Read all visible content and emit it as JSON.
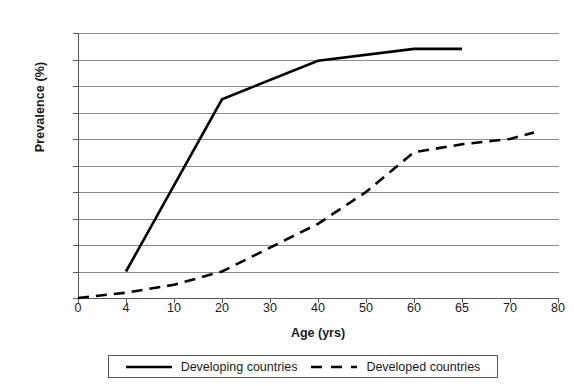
{
  "chart_data": {
    "type": "line",
    "title": "",
    "subtitle": "",
    "xlabel": "Age (yrs)",
    "ylabel": "Prevalence (%)",
    "categories": [
      "0",
      "4",
      "10",
      "20",
      "30",
      "40",
      "50",
      "60",
      "65",
      "70",
      "80"
    ],
    "x_tick_labels": [
      "0",
      "4",
      "10",
      "20",
      "30",
      "40",
      "50",
      "60",
      "65",
      "70",
      "80"
    ],
    "y_tick_labels": [
      "0",
      "10",
      "20",
      "30",
      "40",
      "50",
      "60",
      "70",
      "80",
      "90",
      "100"
    ],
    "ylim": [
      0,
      100
    ],
    "y_step": 10,
    "x_axis_scale": "categorical-even-spacing",
    "grid": "horizontal-only",
    "legend_position": "below-plot",
    "series": [
      {
        "name": "Developing countries",
        "style": "solid",
        "color": "#000000",
        "line_width": 2.6,
        "points": [
          {
            "x": "4",
            "y": 10
          },
          {
            "x": "20",
            "y": 75
          },
          {
            "x": "40",
            "y": 89.5
          },
          {
            "x": "60",
            "y": 94
          },
          {
            "x": "65",
            "y": 94
          }
        ]
      },
      {
        "name": "Developed countries",
        "style": "dashed",
        "color": "#000000",
        "line_width": 2.6,
        "points": [
          {
            "x": "0",
            "y": 0
          },
          {
            "x": "4",
            "y": 2
          },
          {
            "x": "10",
            "y": 5
          },
          {
            "x": "20",
            "y": 10
          },
          {
            "x": "30",
            "y": 19
          },
          {
            "x": "40",
            "y": 28
          },
          {
            "x": "50",
            "y": 40
          },
          {
            "x": "60",
            "y": 55
          },
          {
            "x": "65",
            "y": 58
          },
          {
            "x": "70",
            "y": 60
          },
          {
            "x": "75",
            "y": 62.5
          }
        ]
      }
    ]
  },
  "legend": {
    "entries": [
      {
        "label": "Developing countries",
        "style": "solid"
      },
      {
        "label": "Developed countries",
        "style": "dashed"
      }
    ]
  },
  "colors": {
    "axis": "#585858",
    "grid": "#8c8c8c",
    "series": "#000000",
    "background": "#ffffff"
  }
}
